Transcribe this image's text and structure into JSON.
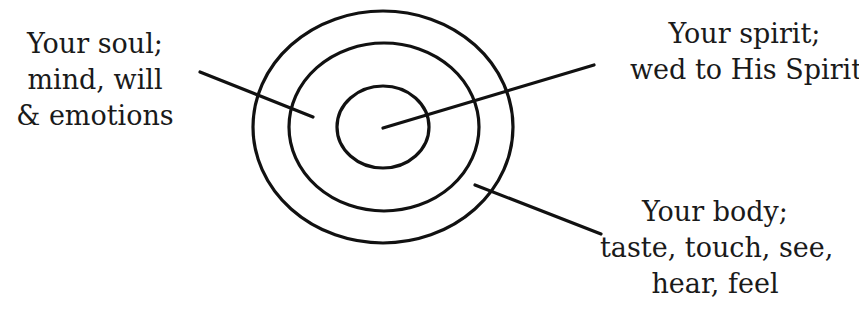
{
  "diagram": {
    "stroke_color": "#111111",
    "ellipses": [
      {
        "name": "body",
        "cx": 383,
        "cy": 127,
        "rx": 130,
        "ry": 116
      },
      {
        "name": "soul",
        "cx": 384,
        "cy": 127,
        "rx": 95,
        "ry": 84
      },
      {
        "name": "spirit",
        "cx": 383,
        "cy": 127,
        "rx": 46,
        "ry": 41
      }
    ],
    "pointers": [
      {
        "name": "soul",
        "x1": 200,
        "y1": 72,
        "x2": 313,
        "y2": 117
      },
      {
        "name": "spirit",
        "x1": 383,
        "y1": 128,
        "x2": 594,
        "y2": 65
      },
      {
        "name": "body",
        "x1": 475,
        "y1": 185,
        "x2": 601,
        "y2": 234
      }
    ]
  },
  "labels": {
    "soul": {
      "line1": "Your soul;",
      "line2": "mind, will",
      "line3": "& emotions"
    },
    "spirit": {
      "line1": "Your spirit;",
      "line2": "wed to His Spirit"
    },
    "body": {
      "line1": "Your body;",
      "line2": "taste, touch, see,",
      "line3": "hear, feel"
    }
  }
}
